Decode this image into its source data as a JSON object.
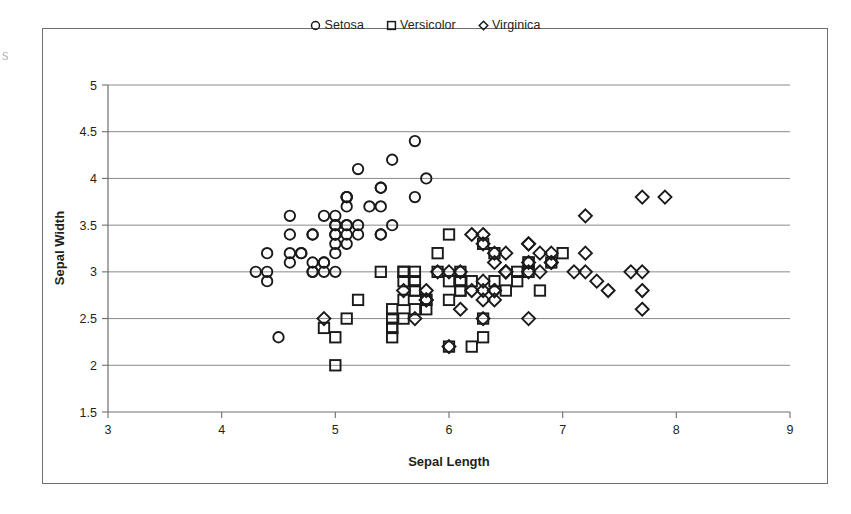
{
  "figure": {
    "scan_artifact_glyph": "s",
    "border_color": "#6e6e6e",
    "marker_color": "#1a1a1a",
    "gridline_color": "#8a8a8a"
  },
  "legend": {
    "position": "top-center",
    "items": [
      {
        "label": "Setosa",
        "marker": "circle-icon"
      },
      {
        "label": "Versicolor",
        "marker": "square-icon"
      },
      {
        "label": "Virginica",
        "marker": "diamond-icon"
      }
    ]
  },
  "chart_data": {
    "type": "scatter",
    "title": "",
    "xlabel": "Sepal Length",
    "ylabel": "Sepal Width",
    "xlim": [
      3,
      9
    ],
    "ylim": [
      1.5,
      5
    ],
    "xticks": [
      "3",
      "4",
      "5",
      "6",
      "7",
      "8",
      "9"
    ],
    "yticks": [
      "1.5",
      "2",
      "2.5",
      "3",
      "3.5",
      "4",
      "4.5",
      "5"
    ],
    "xtick_values": [
      3,
      4,
      5,
      6,
      7,
      8,
      9
    ],
    "ytick_values": [
      1.5,
      2,
      2.5,
      3,
      3.5,
      4,
      4.5,
      5
    ],
    "grid": "horizontal",
    "legend_position": "top-center",
    "series": [
      {
        "name": "Setosa",
        "marker": "circle",
        "points": [
          [
            5.1,
            3.5
          ],
          [
            4.9,
            3.0
          ],
          [
            4.7,
            3.2
          ],
          [
            4.6,
            3.1
          ],
          [
            5.0,
            3.6
          ],
          [
            5.4,
            3.9
          ],
          [
            4.6,
            3.4
          ],
          [
            5.0,
            3.4
          ],
          [
            4.4,
            2.9
          ],
          [
            4.9,
            3.1
          ],
          [
            5.4,
            3.7
          ],
          [
            4.8,
            3.4
          ],
          [
            4.8,
            3.0
          ],
          [
            4.3,
            3.0
          ],
          [
            5.8,
            4.0
          ],
          [
            5.7,
            4.4
          ],
          [
            5.4,
            3.9
          ],
          [
            5.1,
            3.5
          ],
          [
            5.7,
            3.8
          ],
          [
            5.1,
            3.8
          ],
          [
            5.4,
            3.4
          ],
          [
            5.1,
            3.7
          ],
          [
            4.6,
            3.6
          ],
          [
            5.1,
            3.3
          ],
          [
            4.8,
            3.4
          ],
          [
            5.0,
            3.0
          ],
          [
            5.0,
            3.4
          ],
          [
            5.2,
            3.5
          ],
          [
            5.2,
            3.4
          ],
          [
            4.7,
            3.2
          ],
          [
            4.8,
            3.1
          ],
          [
            5.4,
            3.4
          ],
          [
            5.2,
            4.1
          ],
          [
            5.5,
            4.2
          ],
          [
            4.9,
            3.1
          ],
          [
            5.0,
            3.2
          ],
          [
            5.5,
            3.5
          ],
          [
            4.9,
            3.6
          ],
          [
            4.4,
            3.0
          ],
          [
            5.1,
            3.4
          ],
          [
            5.0,
            3.5
          ],
          [
            4.5,
            2.3
          ],
          [
            4.4,
            3.2
          ],
          [
            5.0,
            3.5
          ],
          [
            5.1,
            3.8
          ],
          [
            4.8,
            3.0
          ],
          [
            5.1,
            3.8
          ],
          [
            4.6,
            3.2
          ],
          [
            5.3,
            3.7
          ],
          [
            5.0,
            3.3
          ]
        ]
      },
      {
        "name": "Versicolor",
        "marker": "square",
        "points": [
          [
            7.0,
            3.2
          ],
          [
            6.4,
            3.2
          ],
          [
            6.9,
            3.1
          ],
          [
            5.5,
            2.3
          ],
          [
            6.5,
            2.8
          ],
          [
            5.7,
            2.8
          ],
          [
            6.3,
            3.3
          ],
          [
            4.9,
            2.4
          ],
          [
            6.6,
            2.9
          ],
          [
            5.2,
            2.7
          ],
          [
            5.0,
            2.0
          ],
          [
            5.9,
            3.0
          ],
          [
            6.0,
            2.2
          ],
          [
            6.1,
            2.9
          ],
          [
            5.6,
            2.9
          ],
          [
            6.7,
            3.1
          ],
          [
            5.6,
            3.0
          ],
          [
            5.8,
            2.7
          ],
          [
            6.2,
            2.2
          ],
          [
            5.6,
            2.5
          ],
          [
            5.9,
            3.2
          ],
          [
            6.1,
            2.8
          ],
          [
            6.3,
            2.5
          ],
          [
            6.1,
            2.8
          ],
          [
            6.4,
            2.9
          ],
          [
            6.6,
            3.0
          ],
          [
            6.8,
            2.8
          ],
          [
            6.7,
            3.0
          ],
          [
            6.0,
            2.9
          ],
          [
            5.7,
            2.6
          ],
          [
            5.5,
            2.4
          ],
          [
            5.5,
            2.4
          ],
          [
            5.8,
            2.7
          ],
          [
            6.0,
            2.7
          ],
          [
            5.4,
            3.0
          ],
          [
            6.0,
            3.4
          ],
          [
            6.7,
            3.1
          ],
          [
            6.3,
            2.3
          ],
          [
            5.6,
            3.0
          ],
          [
            5.5,
            2.5
          ],
          [
            5.5,
            2.6
          ],
          [
            6.1,
            3.0
          ],
          [
            5.8,
            2.6
          ],
          [
            5.0,
            2.3
          ],
          [
            5.6,
            2.7
          ],
          [
            5.7,
            3.0
          ],
          [
            5.7,
            2.9
          ],
          [
            6.2,
            2.9
          ],
          [
            5.1,
            2.5
          ],
          [
            5.7,
            2.8
          ]
        ]
      },
      {
        "name": "Virginica",
        "marker": "diamond",
        "points": [
          [
            6.3,
            3.3
          ],
          [
            5.8,
            2.7
          ],
          [
            7.1,
            3.0
          ],
          [
            6.3,
            2.9
          ],
          [
            6.5,
            3.0
          ],
          [
            7.6,
            3.0
          ],
          [
            4.9,
            2.5
          ],
          [
            7.3,
            2.9
          ],
          [
            6.7,
            2.5
          ],
          [
            7.2,
            3.6
          ],
          [
            6.5,
            3.2
          ],
          [
            6.4,
            2.7
          ],
          [
            6.8,
            3.0
          ],
          [
            5.7,
            2.5
          ],
          [
            5.8,
            2.8
          ],
          [
            6.4,
            3.2
          ],
          [
            6.5,
            3.0
          ],
          [
            7.7,
            3.8
          ],
          [
            7.7,
            2.6
          ],
          [
            6.0,
            2.2
          ],
          [
            6.9,
            3.2
          ],
          [
            5.6,
            2.8
          ],
          [
            7.7,
            2.8
          ],
          [
            6.3,
            2.7
          ],
          [
            6.7,
            3.3
          ],
          [
            7.2,
            3.2
          ],
          [
            6.2,
            2.8
          ],
          [
            6.1,
            3.0
          ],
          [
            6.4,
            2.8
          ],
          [
            7.2,
            3.0
          ],
          [
            7.4,
            2.8
          ],
          [
            7.9,
            3.8
          ],
          [
            6.4,
            2.8
          ],
          [
            6.3,
            2.8
          ],
          [
            6.1,
            2.6
          ],
          [
            7.7,
            3.0
          ],
          [
            6.3,
            3.4
          ],
          [
            6.4,
            3.1
          ],
          [
            6.0,
            3.0
          ],
          [
            6.9,
            3.1
          ],
          [
            6.7,
            3.1
          ],
          [
            6.9,
            3.1
          ],
          [
            5.8,
            2.7
          ],
          [
            6.8,
            3.2
          ],
          [
            6.7,
            3.3
          ],
          [
            6.7,
            3.0
          ],
          [
            6.3,
            2.5
          ],
          [
            6.5,
            3.0
          ],
          [
            6.2,
            3.4
          ],
          [
            5.9,
            3.0
          ]
        ]
      }
    ]
  }
}
